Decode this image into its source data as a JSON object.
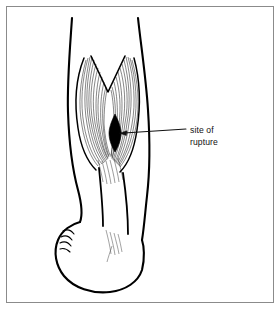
{
  "figure": {
    "domain": "Diagram",
    "background_color": "#ffffff",
    "border_color": "#8b8b8b",
    "ink_color": "#000000",
    "fiber_color": "#1a1a1a"
  },
  "annotations": [
    {
      "id": "rupture-callout",
      "line1": "site of",
      "line2": "rupture",
      "text_x": 190,
      "text_y_line1": 130,
      "text_y_line2": 142,
      "leader_from_x": 186,
      "leader_from_y": 129,
      "leader_to_x": 121,
      "leader_to_y": 133,
      "arrow_direction": "left"
    }
  ],
  "anatomy": {
    "leg_label": "lower-leg-posterior-view",
    "muscle_label": "gastrocnemius-muscle",
    "tendon_label": "achilles-tendon",
    "foot_label": "foot",
    "rupture_label": "rupture-site-marker",
    "rupture_marker": {
      "center_x": 115,
      "center_y": 133,
      "half_width": 6,
      "half_height": 19,
      "fill": "#000000"
    }
  },
  "shapes": {
    "leg_outline_left": "M 72,18 C 70,48 67,82 68,112 C 69,142 72,168 78,190 C 82,205 83,214 80,222",
    "leg_outline_right": "M 138,18 C 141,46 146,78 148,110 C 150,140 150,170 147,196 C 145,214 144,228 142,240",
    "muscle_outer_left": "M 84,58 C 76,78 74,102 78,128 C 81,148 88,162 96,170",
    "muscle_outer_right": "M 134,58 C 140,80 141,104 137,130 C 134,150 128,164 120,172",
    "muscle_notch": "M 92,56 L 108,92 L 124,56",
    "achilles_left": "M 100,168 C 102,186 104,206 104,224",
    "achilles_right": "M 124,172 C 126,192 128,212 128,232",
    "foot_outline": "M 80,222 C 72,224 62,230 58,240 C 53,252 56,266 64,276 C 74,288 92,294 110,292 C 126,290 138,282 142,270 C 145,258 144,246 142,240",
    "toe_lines": [
      "M 63,232 C 67,230 71,231 74,234",
      "M 61,238 C 65,236 69,237 72,240",
      "M 60,244 C 64,242 68,243 71,246",
      "M 60,250 C 63,249 67,250 70,252"
    ]
  }
}
